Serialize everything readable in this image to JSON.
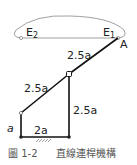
{
  "diagram": {
    "points": {
      "E2": "E",
      "E2_sub": "2",
      "E1": "E",
      "E1_sub": "1",
      "A": "A"
    },
    "links": {
      "upper_coupler": "2.5a",
      "lower_coupler": "2.5a",
      "right_rocker": "2.5a",
      "left_crank": "a",
      "ground": "2a"
    },
    "caption": {
      "figure_label": "圖 1-2",
      "title": "直線連桿機構"
    }
  }
}
